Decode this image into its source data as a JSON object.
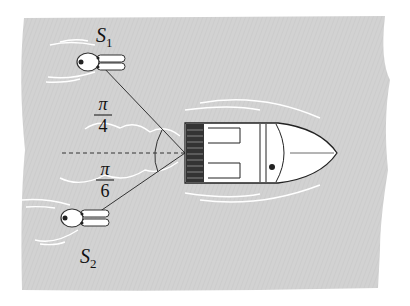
{
  "figure": {
    "labels": {
      "s1": {
        "main": "S",
        "sub": "1"
      },
      "s2": {
        "main": "S",
        "sub": "2"
      },
      "angle_top": {
        "num": "π",
        "den": "4"
      },
      "angle_bottom": {
        "num": "π",
        "den": "6"
      }
    },
    "colors": {
      "water": "#d4d4d4",
      "line": "#222222",
      "wake": "#ffffff",
      "hull": "#ffffff",
      "stern_grille": "#333333"
    }
  }
}
